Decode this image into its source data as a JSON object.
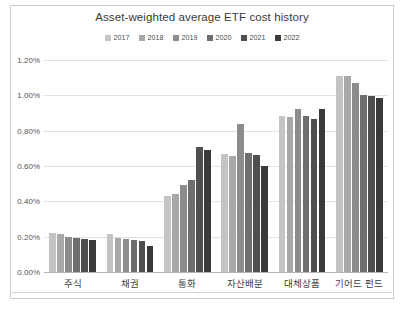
{
  "chart_data": {
    "type": "bar",
    "title": "Asset-weighted average ETF cost history",
    "xlabel": "",
    "ylabel": "",
    "ylim": [
      0,
      1.2
    ],
    "ytick_values": [
      1.2,
      1.0,
      0.8,
      0.6,
      0.4,
      0.2,
      0.0
    ],
    "ytick_labels": [
      "1.20%",
      "1.00%",
      "0.80%",
      "0.60%",
      "0.40%",
      "0.20%",
      "0.00%"
    ],
    "grid": true,
    "legend_position": "top",
    "categories": [
      "주식",
      "채권",
      "통화",
      "자산배분",
      "대체상품",
      "기어드 펀드"
    ],
    "series": [
      {
        "name": "2017",
        "color": "#c4c4c4",
        "values": [
          0.22,
          0.215,
          0.43,
          0.67,
          0.885,
          1.11
        ]
      },
      {
        "name": "2018",
        "color": "#a8a8a8",
        "values": [
          0.215,
          0.195,
          0.44,
          0.655,
          0.875,
          1.11
        ]
      },
      {
        "name": "2019",
        "color": "#8c8c8c",
        "values": [
          0.2,
          0.185,
          0.49,
          0.84,
          0.92,
          1.07
        ]
      },
      {
        "name": "2020",
        "color": "#6e6e6e",
        "values": [
          0.195,
          0.18,
          0.52,
          0.675,
          0.885,
          1.0
        ]
      },
      {
        "name": "2021",
        "color": "#4f4f4f",
        "values": [
          0.185,
          0.175,
          0.71,
          0.665,
          0.865,
          0.995
        ]
      },
      {
        "name": "2022",
        "color": "#3a3a3a",
        "values": [
          0.18,
          0.15,
          0.69,
          0.6,
          0.925,
          0.985
        ]
      }
    ]
  }
}
